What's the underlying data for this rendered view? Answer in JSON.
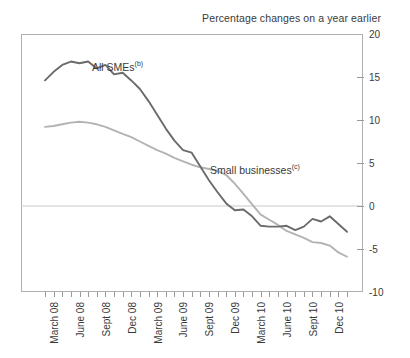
{
  "chart_data": {
    "type": "line",
    "title": "Percentage changes on a year earlier",
    "xlabel": "",
    "ylabel": "",
    "ylim": [
      -10,
      20
    ],
    "yticks": [
      20,
      15,
      10,
      5,
      0,
      -5,
      -10
    ],
    "ytick_labels": [
      "20",
      "15",
      "10",
      "5",
      "0",
      "-5",
      "-10"
    ],
    "grid": false,
    "zero_line": true,
    "legend_position": "inline-annotation",
    "x_tick_labels": [
      "March 08",
      "June 08",
      "Sept 08",
      "Dec 08",
      "March 09",
      "June 09",
      "Sept 09",
      "Dec 09",
      "March 10",
      "June 10",
      "Sept 10",
      "Dec 10"
    ],
    "x": [
      "Mar 08",
      "Apr 08",
      "May 08",
      "Jun 08",
      "Jul 08",
      "Aug 08",
      "Sep 08",
      "Oct 08",
      "Nov 08",
      "Dec 08",
      "Jan 09",
      "Feb 09",
      "Mar 09",
      "Apr 09",
      "May 09",
      "Jun 09",
      "Jul 09",
      "Aug 09",
      "Sep 09",
      "Oct 09",
      "Nov 09",
      "Dec 09",
      "Jan 10",
      "Feb 10",
      "Mar 10",
      "Apr 10",
      "May 10",
      "Jun 10",
      "Jul 10",
      "Aug 10",
      "Sep 10",
      "Oct 10",
      "Nov 10",
      "Dec 10",
      "Jan 11",
      "Feb 11"
    ],
    "series": [
      {
        "name": "All SMEs",
        "footnote": "(b)",
        "color": "#6b6b6b",
        "values": [
          14.6,
          15.6,
          16.4,
          16.8,
          16.6,
          16.8,
          16.0,
          16.4,
          15.3,
          15.5,
          14.6,
          13.6,
          12.2,
          10.6,
          9.0,
          7.6,
          6.5,
          6.2,
          4.6,
          3.0,
          1.6,
          0.3,
          -0.5,
          -0.4,
          -1.2,
          -2.3,
          -2.4,
          -2.4,
          -2.3,
          -2.8,
          -2.4,
          -1.5,
          -1.8,
          -1.2,
          -2.1,
          -3.0
        ]
      },
      {
        "name": "Small businesses",
        "footnote": "(c)",
        "color": "#b3b3b3",
        "values": [
          9.2,
          9.3,
          9.5,
          9.7,
          9.8,
          9.7,
          9.5,
          9.2,
          8.8,
          8.4,
          8.0,
          7.5,
          7.0,
          6.5,
          6.1,
          5.6,
          5.2,
          4.8,
          4.5,
          4.3,
          4.1,
          3.6,
          2.6,
          1.4,
          0.2,
          -1.0,
          -1.6,
          -2.2,
          -2.9,
          -3.3,
          -3.7,
          -4.2,
          -4.3,
          -4.6,
          -5.4,
          -5.9
        ]
      }
    ]
  },
  "axes": {
    "y_tick_labels": [
      "20",
      "15",
      "10",
      "5",
      "0",
      "-5",
      "-10"
    ],
    "x_tick_labels": [
      "March 08",
      "June 08",
      "Sept 08",
      "Dec 08",
      "March 09",
      "June 09",
      "Sept 09",
      "Dec 09",
      "March 10",
      "June 10",
      "Sept 10",
      "Dec 10"
    ]
  },
  "annotations": {
    "all_smes": "All SMEs",
    "all_smes_footnote": "(b)",
    "small_businesses": "Small businesses",
    "small_businesses_footnote": "(c)"
  },
  "colors": {
    "all_smes": "#6b6b6b",
    "small_businesses": "#b3b3b3",
    "frame": "#b0b0b0",
    "zero_line": "#c9c9c9",
    "text": "#3a3a3a"
  }
}
